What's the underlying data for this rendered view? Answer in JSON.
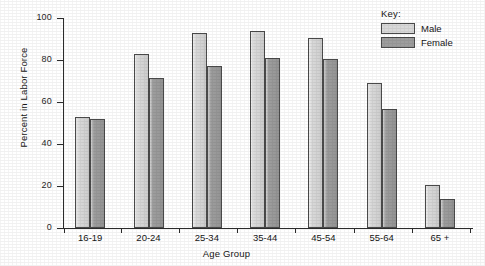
{
  "chart_data": {
    "type": "bar",
    "title": "",
    "xlabel": "Age Group",
    "ylabel": "Percent in Labor Force",
    "categories": [
      "16-19",
      "20-24",
      "25-34",
      "35-44",
      "45-54",
      "55-64",
      "65 +"
    ],
    "series": [
      {
        "name": "Male",
        "color": "#d9d9d9",
        "values": [
          53,
          83,
          93,
          94,
          90.5,
          69,
          20.5
        ]
      },
      {
        "name": "Female",
        "color": "#9d9d9d",
        "values": [
          52,
          71.5,
          77,
          81,
          80.5,
          56.5,
          14
        ]
      }
    ],
    "ylim": [
      0,
      100
    ],
    "yticks": [
      0,
      20,
      40,
      60,
      80,
      100
    ],
    "ytick_labels": [
      "0",
      "20",
      "40",
      "60",
      "80",
      "100"
    ],
    "grid": false,
    "legend": {
      "title": "Key:",
      "position": "top-right",
      "entries": [
        "Male",
        "Female"
      ]
    }
  },
  "legend": {
    "title": "Key:",
    "male_label": "Male",
    "female_label": "Female"
  },
  "axes": {
    "y_title": "Percent in Labor Force",
    "x_title": "Age Group"
  }
}
